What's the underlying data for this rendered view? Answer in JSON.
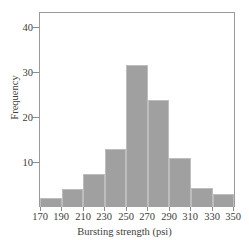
{
  "chart_data": {
    "type": "bar",
    "title": "",
    "subtitle": "",
    "xlabel": "Bursting strength (psi)",
    "ylabel": "Frequency",
    "categories": [
      "170-190",
      "190-210",
      "210-230",
      "230-250",
      "250-270",
      "270-290",
      "290-310",
      "310-330",
      "330-350"
    ],
    "bin_edges": [
      170,
      190,
      210,
      230,
      250,
      270,
      290,
      310,
      330,
      350
    ],
    "values": [
      2,
      4,
      7.4,
      13.2,
      32.3,
      24.3,
      11.2,
      4.2,
      3
    ],
    "xlim": [
      170,
      350
    ],
    "ylim": [
      0,
      44
    ],
    "xticks": [
      170,
      190,
      210,
      230,
      250,
      270,
      290,
      310,
      330,
      350
    ],
    "xtick_labels": [
      "170",
      "190",
      "210",
      "230",
      "250",
      "270",
      "290",
      "310",
      "330",
      "350"
    ],
    "yticks": [
      10,
      20,
      30,
      40
    ],
    "ytick_labels": [
      "10",
      "20",
      "30",
      "40"
    ],
    "grid": false,
    "legend": null,
    "legend_position": "none",
    "bar_color": "#a0a0a0",
    "bar_edge_color": "#bdbdbd",
    "frame_color": "#9a9a9a",
    "text_color": "#3d3d3d",
    "background": "#ffffff"
  }
}
